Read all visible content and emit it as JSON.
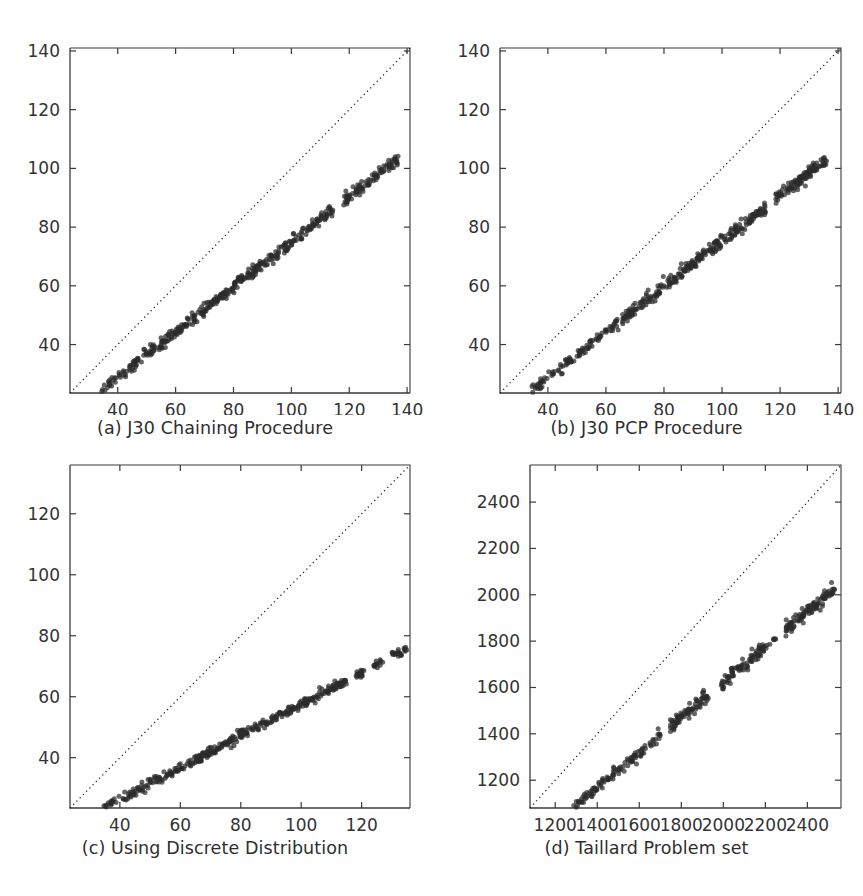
{
  "figure": {
    "title": "",
    "layout": "2x2 grid of scatter plots",
    "background_color": "#ffffff",
    "point_color": "#2b2b2b",
    "diagonal_line_color": "#1a1a1a",
    "axis_color": "#3a3a3a"
  },
  "panels": [
    {
      "id": "a",
      "caption": "(a) J30 Chaining Procedure",
      "position": "top-left"
    },
    {
      "id": "b",
      "caption": "(b) J30 PCP Procedure",
      "position": "top-right"
    },
    {
      "id": "c",
      "caption": "(c) Using Discrete Distribution",
      "position": "bottom-left"
    },
    {
      "id": "d",
      "caption": "(d) Taillard Problem set",
      "position": "bottom-right"
    }
  ],
  "chart_data": [
    {
      "type": "scatter",
      "id": "a",
      "title": "(a) J30 Chaining Procedure",
      "xlabel": "",
      "ylabel": "",
      "xlim": [
        23.5,
        141
      ],
      "ylim": [
        23.5,
        141
      ],
      "xticks": [
        40,
        60,
        80,
        100,
        120,
        140
      ],
      "yticks": [
        40,
        60,
        80,
        100,
        120,
        140
      ],
      "xtick_labels": [
        "40",
        "60",
        "80",
        "100",
        "120",
        "140"
      ],
      "ytick_labels": [
        "40",
        "60",
        "80",
        "100",
        "120",
        "140"
      ],
      "grid": false,
      "legend": "none",
      "annotations": [
        "dotted identity line y = x spanning full axis"
      ],
      "reference_line": {
        "type": "identity",
        "style": "dotted",
        "from": [
          23.5,
          23.5
        ],
        "to": [
          141,
          141
        ]
      },
      "cluster": {
        "description": "dense near-linear band lying below the identity line",
        "x_range": [
          34,
          137
        ],
        "y_range": [
          24,
          103
        ],
        "fit_slope": 0.77,
        "fit_intercept": -2.0,
        "band_half_width": 1.9,
        "n_points": 480,
        "gaps_x": [
          [
            114.5,
            118.0
          ]
        ]
      }
    },
    {
      "type": "scatter",
      "id": "b",
      "title": "(b) J30 PCP Procedure",
      "xlabel": "",
      "ylabel": "",
      "xlim": [
        23.5,
        141
      ],
      "ylim": [
        23.5,
        141
      ],
      "xticks": [
        40,
        60,
        80,
        100,
        120,
        140
      ],
      "yticks": [
        40,
        60,
        80,
        100,
        120,
        140
      ],
      "xtick_labels": [
        "40",
        "60",
        "80",
        "100",
        "120",
        "140"
      ],
      "ytick_labels": [
        "40",
        "60",
        "80",
        "100",
        "120",
        "140"
      ],
      "grid": false,
      "legend": "none",
      "annotations": [
        "dotted identity line y = x spanning full axis"
      ],
      "reference_line": {
        "type": "identity",
        "style": "dotted",
        "from": [
          23.5,
          23.5
        ],
        "to": [
          141,
          141
        ]
      },
      "cluster": {
        "description": "dense near-linear band lying below the identity line",
        "x_range": [
          34,
          136
        ],
        "y_range": [
          24,
          103
        ],
        "fit_slope": 0.775,
        "fit_intercept": -2.3,
        "band_half_width": 1.8,
        "n_points": 480,
        "gaps_x": [
          [
            115.0,
            118.5
          ]
        ]
      }
    },
    {
      "type": "scatter",
      "id": "c",
      "title": "(c) Using Discrete Distribution",
      "xlabel": "",
      "ylabel": "",
      "xlim": [
        23.5,
        136
      ],
      "ylim": [
        23.5,
        136
      ],
      "xticks": [
        40,
        60,
        80,
        100,
        120
      ],
      "yticks": [
        40,
        60,
        80,
        100,
        120
      ],
      "xtick_labels": [
        "40",
        "60",
        "80",
        "100",
        "120"
      ],
      "ytick_labels": [
        "40",
        "60",
        "80",
        "100",
        "120"
      ],
      "grid": false,
      "legend": "none",
      "annotations": [
        "dotted identity line y = x spanning full axis"
      ],
      "reference_line": {
        "type": "identity",
        "style": "dotted",
        "from": [
          23.5,
          136
        ],
        "to": [
          136,
          136
        ]
      },
      "cluster": {
        "description": "dense near-linear band well below the identity line with sparse tail beyond x=117",
        "x_range": [
          33,
          135
        ],
        "y_range": [
          24,
          78
        ],
        "fit_slope": 0.52,
        "fit_intercept": 5.5,
        "band_half_width": 1.6,
        "n_points": 470,
        "gaps_x": [
          [
            115.0,
            118.0
          ],
          [
            121.0,
            124.0
          ],
          [
            127.0,
            130.0
          ]
        ]
      }
    },
    {
      "type": "scatter",
      "id": "d",
      "title": "(d) Taillard Problem set",
      "xlabel": "",
      "ylabel": "",
      "xlim": [
        1080,
        2560
      ],
      "ylim": [
        1080,
        2560
      ],
      "xticks": [
        1200,
        1400,
        1600,
        1800,
        2000,
        2200,
        2400
      ],
      "yticks": [
        1200,
        1400,
        1600,
        1800,
        2000,
        2200,
        2400
      ],
      "xtick_labels": [
        "1200",
        "1400",
        "1600",
        "1800",
        "2000",
        "2200",
        "2400"
      ],
      "ytick_labels": [
        "1200",
        "1400",
        "1600",
        "1800",
        "2000",
        "2200",
        "2400"
      ],
      "grid": false,
      "legend": "none",
      "annotations": [
        "dotted identity line y = x spanning full axis"
      ],
      "reference_line": {
        "type": "identity",
        "style": "dotted",
        "from": [
          1080,
          1080
        ],
        "to": [
          2560,
          2560
        ]
      },
      "cluster": {
        "description": "segmented near-linear band below identity line, broken into groups",
        "x_range": [
          1280,
          2530
        ],
        "y_range": [
          1080,
          2030
        ],
        "fit_slope": 0.76,
        "fit_intercept": 105,
        "band_half_width": 26,
        "n_points": 420,
        "gaps_x": [
          [
            1700,
            1745
          ],
          [
            1930,
            1990
          ],
          [
            2250,
            2290
          ]
        ]
      }
    }
  ]
}
